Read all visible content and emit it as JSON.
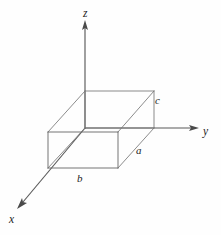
{
  "figure": {
    "background_color": "#fefefe",
    "axis_color": "#595959",
    "edge_color": "#777777",
    "label_color": "#1c1c1c"
  },
  "axes": {
    "origin": {
      "x": 85,
      "y": 128
    },
    "items": [
      {
        "name": "z-axis",
        "label": "z",
        "direction": "up",
        "from": {
          "x": 85,
          "y": 128
        },
        "to": {
          "x": 85,
          "y": 22
        },
        "label_position": {
          "x": 83,
          "y": 8
        }
      },
      {
        "name": "y-axis",
        "label": "y",
        "direction": "right",
        "from": {
          "x": 85,
          "y": 128
        },
        "to": {
          "x": 197,
          "y": 128
        },
        "label_position": {
          "x": 203,
          "y": 126
        }
      },
      {
        "name": "x-axis",
        "label": "x",
        "direction": "lower-left",
        "from": {
          "x": 85,
          "y": 128
        },
        "to": {
          "x": 18,
          "y": 208
        },
        "label_position": {
          "x": 9,
          "y": 214
        }
      }
    ]
  },
  "box": {
    "name": "rectangular-box",
    "vertices": {
      "back_top_left": {
        "x": 85,
        "y": 91
      },
      "back_top_right": {
        "x": 154,
        "y": 91
      },
      "back_bottom_left": {
        "x": 85,
        "y": 128
      },
      "back_bottom_right": {
        "x": 154,
        "y": 128
      },
      "front_top_left": {
        "x": 48,
        "y": 132
      },
      "front_top_right": {
        "x": 118,
        "y": 132
      },
      "front_bottom_left": {
        "x": 48,
        "y": 168
      },
      "front_bottom_right": {
        "x": 118,
        "y": 168
      }
    },
    "dimension_labels": [
      {
        "name": "dim-a",
        "label": "a",
        "edge": "depth-along-x",
        "position": {
          "x": 136,
          "y": 145
        }
      },
      {
        "name": "dim-b",
        "label": "b",
        "edge": "width-along-y",
        "position": {
          "x": 77,
          "y": 173
        }
      },
      {
        "name": "dim-c",
        "label": "c",
        "edge": "height-along-z",
        "position": {
          "x": 155,
          "y": 95
        }
      }
    ]
  }
}
